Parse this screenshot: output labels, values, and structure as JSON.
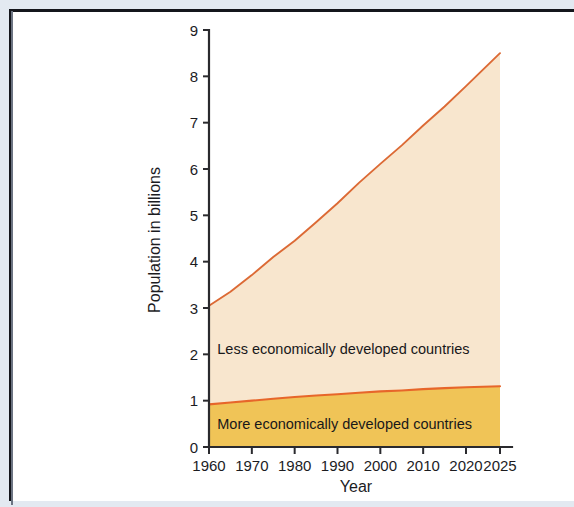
{
  "figure": {
    "background_color": "#ffffff",
    "page_margin_color": "#e3e9f1",
    "frame_color": "#14161c"
  },
  "chart_data": {
    "type": "area",
    "stacked": true,
    "title": "",
    "subtitle": "",
    "xlabel": "Year",
    "ylabel": "Population in billions",
    "xlim": [
      1960,
      2025
    ],
    "ylim": [
      0,
      9
    ],
    "grid": false,
    "legend_position": "inline-band-labels",
    "x_tick_labels": [
      "1960",
      "1970",
      "1980",
      "1990",
      "2000",
      "2010",
      "2020",
      "2025"
    ],
    "x_ticks": [
      1960,
      1970,
      1980,
      1990,
      2000,
      2010,
      2020,
      2025
    ],
    "y_tick_labels": [
      "0",
      "1",
      "2",
      "3",
      "4",
      "5",
      "6",
      "7",
      "8",
      "9"
    ],
    "y_ticks": [
      0,
      1,
      2,
      3,
      4,
      5,
      6,
      7,
      8,
      9
    ],
    "x": [
      1960,
      1965,
      1970,
      1975,
      1980,
      1985,
      1990,
      1995,
      2000,
      2005,
      2010,
      2015,
      2020,
      2025
    ],
    "series": [
      {
        "name": "More economically developed countries",
        "color": "#f0c457",
        "line_color": "#e7662a",
        "values": [
          0.92,
          0.96,
          1.0,
          1.04,
          1.08,
          1.11,
          1.14,
          1.17,
          1.2,
          1.22,
          1.25,
          1.27,
          1.29,
          1.31
        ]
      },
      {
        "name": "Less economically developed countries",
        "color": "#f8e6ce",
        "line_color": "#dc6a35",
        "values": [
          2.13,
          2.39,
          2.71,
          3.06,
          3.37,
          3.74,
          4.12,
          4.53,
          4.91,
          5.29,
          5.69,
          6.08,
          6.5,
          7.19
        ]
      }
    ],
    "totals": [
      3.05,
      3.35,
      3.71,
      4.1,
      4.45,
      4.85,
      5.26,
      5.7,
      6.11,
      6.51,
      6.94,
      7.35,
      7.79,
      8.5
    ],
    "annotations": [
      {
        "text": "Less economically developed countries",
        "x": 1961,
        "y": 2.12
      },
      {
        "text": "More economically developed countries",
        "x": 1961,
        "y": 0.5
      }
    ]
  }
}
